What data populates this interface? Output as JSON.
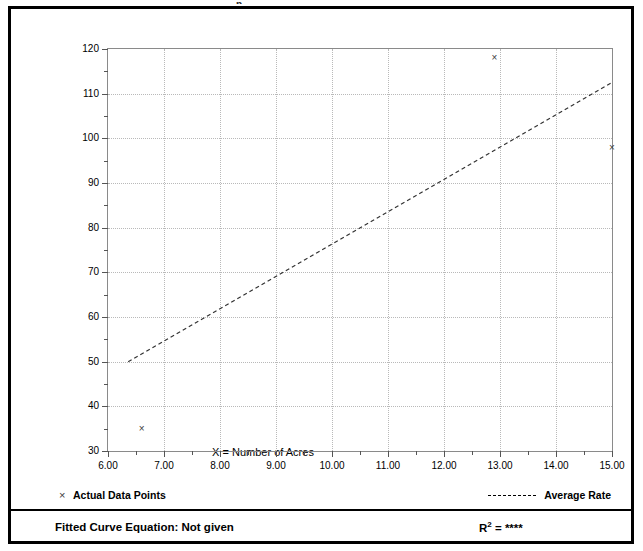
{
  "figure": {
    "border_color": "#000000",
    "background": "#ffffff",
    "top_clipped_text": "p"
  },
  "legend": {
    "actual_points": {
      "marker": "x-marker-icon",
      "label": "Actual Data Points"
    },
    "average_rate": {
      "marker": "dashed-line-icon",
      "label": "Average Rate"
    }
  },
  "footer": {
    "equation_label": "Fitted Curve Equation:  Not given",
    "r_squared_prefix": "R",
    "r_squared_exponent": "2",
    "r_squared_value": "= ****"
  },
  "chart_data": {
    "type": "scatter",
    "title": "",
    "xlabel": "X = Number of Acres",
    "ylabel": "T = Average Vehicle Trip Ends",
    "xlim": [
      6.0,
      15.0
    ],
    "ylim": [
      30,
      120
    ],
    "grid": true,
    "legend_position": "below-plot",
    "xticks": [
      6.0,
      7.0,
      8.0,
      9.0,
      10.0,
      11.0,
      12.0,
      13.0,
      14.0,
      15.0
    ],
    "xtick_labels": [
      "6.00",
      "7.00",
      "8.00",
      "9.00",
      "10.00",
      "11.00",
      "12.00",
      "13.00",
      "14.00",
      "15.00"
    ],
    "xticks_minor": [
      6.5,
      7.5,
      8.5,
      9.5,
      10.5,
      11.5,
      12.5,
      13.5,
      14.5
    ],
    "yticks": [
      30,
      40,
      50,
      60,
      70,
      80,
      90,
      100,
      110,
      120
    ],
    "ytick_labels": [
      "30",
      "40",
      "50",
      "60",
      "70",
      "80",
      "90",
      "100",
      "110",
      "120"
    ],
    "yticks_minor": [
      35,
      45,
      55,
      65,
      75,
      85,
      95,
      105,
      115
    ],
    "series": [
      {
        "name": "Actual Data Points",
        "type": "scatter",
        "marker": "x",
        "color": "#3b3b3b",
        "points": [
          {
            "x": 6.6,
            "y": 35
          },
          {
            "x": 12.9,
            "y": 118
          },
          {
            "x": 15.0,
            "y": 98
          }
        ]
      },
      {
        "name": "Average Rate",
        "type": "line",
        "style": "dashed",
        "color": "#333333",
        "points": [
          {
            "x": 6.36,
            "y": 50
          },
          {
            "x": 15.0,
            "y": 112.5
          }
        ]
      }
    ]
  }
}
